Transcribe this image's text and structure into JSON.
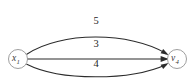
{
  "figure": {
    "type": "directed-multigraph",
    "background_color": "#ffffff",
    "edge_color": "#2b2b2b",
    "node_stroke_color": "#8d8d8d",
    "node_fill_color": "#ffffff",
    "label_color": "#1f1f1f"
  },
  "nodes": [
    {
      "id": "source",
      "label_base": "x",
      "label_sub": "1",
      "cx": 18,
      "cy": 59,
      "r": 9.5
    },
    {
      "id": "target",
      "label_base": "v",
      "label_sub": "4",
      "cx": 177,
      "cy": 59,
      "r": 9.5
    }
  ],
  "edges": [
    {
      "id": "edge-top",
      "from": "source",
      "to": "target",
      "weight": "5",
      "label_x": 96,
      "label_y": 22,
      "path": "M 26.8 54.2 C 60 31.5, 130 31.5, 166.5 53.6",
      "arrow_points": "168.6,55.0 160.6,53.2 163.2,49.0",
      "directed": true
    },
    {
      "id": "edge-middle",
      "from": "source",
      "to": "target",
      "weight": "3",
      "label_x": 96,
      "label_y": 45,
      "path": "M 27.5 59 L 166.2 59",
      "arrow_points": "168.8,59 160.6,62.0 160.6,56.0",
      "directed": true
    },
    {
      "id": "edge-bottom",
      "from": "source",
      "to": "target",
      "weight": "4",
      "label_x": 96,
      "label_y": 65,
      "path": "M 26.8 64.2 C 60 81.0, 130 81.0, 166.5 64.4",
      "arrow_points": "168.6,63.0 163.2,69.0 160.6,64.8",
      "directed": true
    }
  ]
}
